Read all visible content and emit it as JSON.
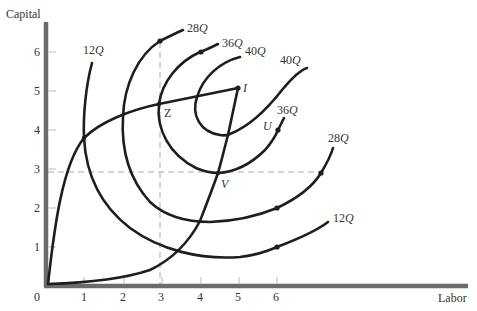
{
  "axes": {
    "y_title": "Capital",
    "x_title": "Labor",
    "origin_label": "0",
    "x_ticks": [
      "1",
      "2",
      "3",
      "4",
      "5",
      "6"
    ],
    "y_ticks": [
      "1",
      "2",
      "3",
      "4",
      "5",
      "6"
    ]
  },
  "isoquants": {
    "q12_top": {
      "num": "12",
      "unit": "Q"
    },
    "q28_top": {
      "num": "28",
      "unit": "Q"
    },
    "q36_top": {
      "num": "36",
      "unit": "Q"
    },
    "q40_top": {
      "num": "40",
      "unit": "Q"
    },
    "q40_right": {
      "num": "40",
      "unit": "Q"
    },
    "q36_right": {
      "num": "36",
      "unit": "Q"
    },
    "q28_right": {
      "num": "28",
      "unit": "Q"
    },
    "q12_right": {
      "num": "12",
      "unit": "Q"
    }
  },
  "points": {
    "I": "I",
    "Z": "Z",
    "U": "U",
    "V": "V"
  },
  "colors": {
    "curve": "#1e1e1e",
    "axis": "#6b6b6b",
    "dashed": "#aaaaaa"
  }
}
